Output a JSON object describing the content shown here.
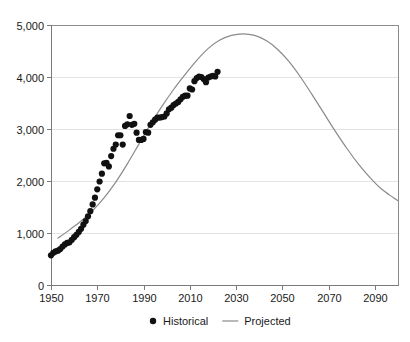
{
  "chart_data": {
    "type": "scatter",
    "title": "",
    "subtitle": "",
    "xlabel": "",
    "ylabel": "",
    "xlim": [
      1950,
      2100
    ],
    "ylim": [
      0,
      5000
    ],
    "grid": true,
    "legend_position": "bottom-center",
    "x_ticks": [
      1950,
      1970,
      1990,
      2010,
      2030,
      2050,
      2070,
      2090
    ],
    "x_tick_labels": [
      "1950",
      "1970",
      "1990",
      "2010",
      "2030",
      "2050",
      "2070",
      "2090"
    ],
    "y_ticks": [
      0,
      1000,
      2000,
      3000,
      4000,
      5000
    ],
    "y_tick_labels": [
      "0",
      "1,000",
      "2,000",
      "3,000",
      "4,000",
      "5,000"
    ],
    "series": [
      {
        "name": "Historical",
        "type": "scatter",
        "marker": "circle",
        "color": "#111111",
        "points": [
          [
            1950,
            570
          ],
          [
            1951,
            620
          ],
          [
            1952,
            645
          ],
          [
            1953,
            660
          ],
          [
            1954,
            690
          ],
          [
            1955,
            740
          ],
          [
            1956,
            780
          ],
          [
            1957,
            810
          ],
          [
            1958,
            820
          ],
          [
            1959,
            870
          ],
          [
            1960,
            920
          ],
          [
            1961,
            965
          ],
          [
            1962,
            1020
          ],
          [
            1963,
            1080
          ],
          [
            1964,
            1160
          ],
          [
            1965,
            1230
          ],
          [
            1966,
            1320
          ],
          [
            1967,
            1420
          ],
          [
            1968,
            1550
          ],
          [
            1969,
            1680
          ],
          [
            1970,
            1840
          ],
          [
            1971,
            1990
          ],
          [
            1972,
            2140
          ],
          [
            1973,
            2340
          ],
          [
            1974,
            2350
          ],
          [
            1975,
            2280
          ],
          [
            1976,
            2480
          ],
          [
            1977,
            2620
          ],
          [
            1978,
            2700
          ],
          [
            1979,
            2880
          ],
          [
            1980,
            2880
          ],
          [
            1981,
            2700
          ],
          [
            1982,
            3060
          ],
          [
            1983,
            3090
          ],
          [
            1984,
            3250
          ],
          [
            1985,
            3080
          ],
          [
            1986,
            3100
          ],
          [
            1987,
            2930
          ],
          [
            1988,
            2790
          ],
          [
            1989,
            2790
          ],
          [
            1990,
            2810
          ],
          [
            1991,
            2940
          ],
          [
            1992,
            2930
          ],
          [
            1993,
            3080
          ],
          [
            1994,
            3130
          ],
          [
            1995,
            3180
          ],
          [
            1996,
            3220
          ],
          [
            1997,
            3220
          ],
          [
            1998,
            3230
          ],
          [
            1999,
            3240
          ],
          [
            2000,
            3300
          ],
          [
            2001,
            3380
          ],
          [
            2002,
            3410
          ],
          [
            2003,
            3460
          ],
          [
            2004,
            3490
          ],
          [
            2005,
            3520
          ],
          [
            2006,
            3570
          ],
          [
            2007,
            3620
          ],
          [
            2008,
            3640
          ],
          [
            2009,
            3640
          ],
          [
            2010,
            3780
          ],
          [
            2011,
            3760
          ],
          [
            2012,
            3920
          ],
          [
            2013,
            3980
          ],
          [
            2014,
            4010
          ],
          [
            2015,
            4000
          ],
          [
            2016,
            3960
          ],
          [
            2017,
            3900
          ],
          [
            2018,
            3990
          ],
          [
            2019,
            4010
          ],
          [
            2020,
            4020
          ],
          [
            2021,
            4010
          ],
          [
            2022,
            4100
          ]
        ]
      },
      {
        "name": "Projected",
        "type": "line",
        "color": "#8a8a8a",
        "points": [
          [
            1953,
            900
          ],
          [
            1958,
            1060
          ],
          [
            1963,
            1230
          ],
          [
            1968,
            1430
          ],
          [
            1973,
            1680
          ],
          [
            1978,
            1980
          ],
          [
            1983,
            2330
          ],
          [
            1988,
            2710
          ],
          [
            1993,
            3090
          ],
          [
            1998,
            3440
          ],
          [
            2003,
            3760
          ],
          [
            2008,
            4050
          ],
          [
            2013,
            4320
          ],
          [
            2018,
            4550
          ],
          [
            2023,
            4710
          ],
          [
            2028,
            4800
          ],
          [
            2033,
            4830
          ],
          [
            2038,
            4800
          ],
          [
            2043,
            4700
          ],
          [
            2048,
            4530
          ],
          [
            2053,
            4290
          ],
          [
            2058,
            3990
          ],
          [
            2063,
            3650
          ],
          [
            2068,
            3300
          ],
          [
            2073,
            2950
          ],
          [
            2078,
            2620
          ],
          [
            2083,
            2320
          ],
          [
            2088,
            2060
          ],
          [
            2093,
            1840
          ],
          [
            2098,
            1680
          ],
          [
            2100,
            1620
          ]
        ],
        "peak_year": 2033,
        "peak_value": 4830
      }
    ],
    "legend": [
      {
        "label": "Historical",
        "marker": "dot",
        "color": "#111111"
      },
      {
        "label": "Projected",
        "marker": "line",
        "color": "#8a8a8a"
      }
    ]
  }
}
